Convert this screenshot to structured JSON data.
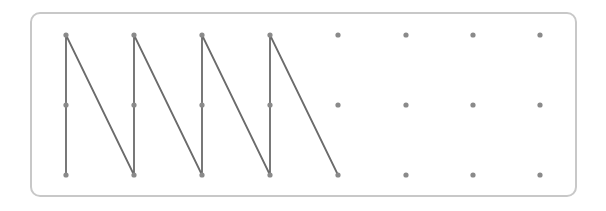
{
  "diagram": {
    "type": "dot-grid-path",
    "grid": {
      "columns_x": [
        66,
        134,
        202,
        270,
        338,
        406,
        473,
        540
      ],
      "rows_y": [
        35,
        105,
        175
      ],
      "dot_color": "#8a8a8a",
      "dot_radius": 2.6
    },
    "path": {
      "color": "#6b6b6b",
      "stroke_width": 1.8,
      "points": [
        [
          66,
          175
        ],
        [
          66,
          35
        ],
        [
          134,
          175
        ],
        [
          134,
          35
        ],
        [
          202,
          175
        ],
        [
          202,
          35
        ],
        [
          270,
          175
        ],
        [
          270,
          35
        ],
        [
          338,
          175
        ]
      ]
    },
    "frame": {
      "border_color": "#c8c8c8"
    }
  }
}
